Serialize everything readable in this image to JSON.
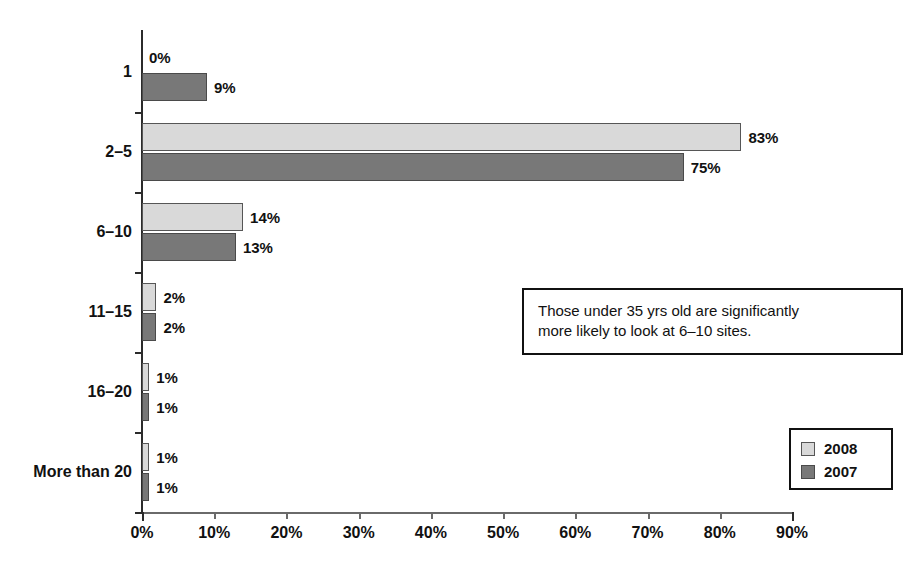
{
  "chart_data": {
    "type": "bar",
    "orientation": "horizontal",
    "title": "",
    "xlabel": "",
    "ylabel": "",
    "grid": false,
    "xlim": [
      0,
      90
    ],
    "xticks": [
      "0%",
      "10%",
      "20%",
      "30%",
      "40%",
      "50%",
      "60%",
      "70%",
      "80%",
      "90%"
    ],
    "xtick_values": [
      0,
      10,
      20,
      30,
      40,
      50,
      60,
      70,
      80,
      90
    ],
    "categories": [
      "1",
      "2–5",
      "6–10",
      "11–15",
      "16–20",
      "More than 20"
    ],
    "series": [
      {
        "name": "2008",
        "color": "#d9d9d9",
        "values": [
          0,
          83,
          14,
          2,
          1,
          1
        ],
        "labels": [
          "0%",
          "83%",
          "14%",
          "2%",
          "1%",
          "1%"
        ]
      },
      {
        "name": "2007",
        "color": "#787878",
        "values": [
          9,
          75,
          13,
          2,
          1,
          1
        ],
        "labels": [
          "9%",
          "75%",
          "13%",
          "2%",
          "1%",
          "1%"
        ]
      }
    ],
    "legend": {
      "position": "bottom-right",
      "entries": [
        "2008",
        "2007"
      ]
    },
    "annotations": [
      {
        "lines": [
          "Those under 35 yrs old are significantly",
          "more likely to look at 6–10 sites."
        ]
      }
    ]
  },
  "colors": {
    "series_2008": "#d9d9d9",
    "series_2007": "#787878",
    "axis": "#2b2b2b",
    "text": "#111111",
    "background": "#ffffff"
  }
}
